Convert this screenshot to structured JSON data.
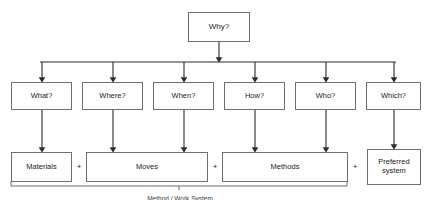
{
  "diagram": {
    "title_node": {
      "label": "Why?",
      "x": 188,
      "y": 12,
      "w": 62,
      "h": 30,
      "font": 8
    },
    "question_row": [
      {
        "label": "What?",
        "x": 11,
        "y": 82,
        "w": 61,
        "h": 28,
        "font": 7.5
      },
      {
        "label": "Where?",
        "x": 82,
        "y": 82,
        "w": 61,
        "h": 28,
        "font": 7.5
      },
      {
        "label": "When?",
        "x": 153,
        "y": 82,
        "w": 61,
        "h": 28,
        "font": 7.5
      },
      {
        "label": "How?",
        "x": 224,
        "y": 82,
        "w": 61,
        "h": 28,
        "font": 7.5
      },
      {
        "label": "Who?",
        "x": 295,
        "y": 82,
        "w": 61,
        "h": 28,
        "font": 7.5
      },
      {
        "label": "Which?",
        "x": 366,
        "y": 82,
        "w": 55,
        "h": 28,
        "font": 7.5
      }
    ],
    "result_row": [
      {
        "label": "Materials",
        "x": 11,
        "y": 152,
        "w": 61,
        "h": 30,
        "font": 7.5
      },
      {
        "label": "Moves",
        "x": 86,
        "y": 152,
        "w": 122,
        "h": 30,
        "font": 7.5
      },
      {
        "label": "Methods",
        "x": 222,
        "y": 152,
        "w": 126,
        "h": 30,
        "font": 7.5
      },
      {
        "label": "Preferred system",
        "x": 367,
        "y": 149,
        "w": 54,
        "h": 36,
        "font": 7.5
      }
    ],
    "operators": [
      {
        "label": "+",
        "x": 74,
        "y": 163,
        "w": 10
      },
      {
        "label": "+",
        "x": 210,
        "y": 163,
        "w": 10
      },
      {
        "label": "+",
        "x": 350,
        "y": 163,
        "w": 10
      }
    ],
    "brace": {
      "left": 11,
      "right": 347,
      "y": 186,
      "depth": 5,
      "center": 179
    },
    "caption": {
      "label": "Method / Work System",
      "x": 60,
      "y": 195,
      "w": 240,
      "font": 6.5
    },
    "bus": {
      "trunk_x": 219,
      "trunk_top": 42,
      "bar_y": 62,
      "bar_left": 40,
      "bar_right": 396
    },
    "colors": {
      "stroke": "#6f6f6f",
      "wire": "#2d2d2d",
      "text": "#1b1b1b",
      "background": "#ffffff"
    }
  }
}
